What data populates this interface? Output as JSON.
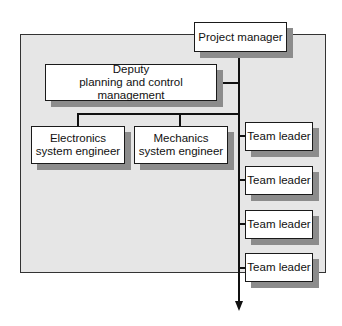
{
  "diagram": {
    "type": "org-chart",
    "colors": {
      "panel_fill": "#e6e6e6",
      "box_fill": "#ffffff",
      "box_border": "#1a1a1a",
      "shadow": "#8c8c8c",
      "line": "#111111"
    },
    "nodes": {
      "project_manager": {
        "lines": [
          "Project manager"
        ]
      },
      "deputy": {
        "lines": [
          "Deputy",
          "planning and control management"
        ]
      },
      "electronics": {
        "lines": [
          "Electronics",
          "system engineer"
        ]
      },
      "mechanics": {
        "lines": [
          "Mechanics",
          "system engineer"
        ]
      },
      "team_leaders": [
        {
          "label": "Team leader"
        },
        {
          "label": "Team leader"
        },
        {
          "label": "Team leader"
        },
        {
          "label": "Team leader"
        }
      ]
    },
    "edges": [
      {
        "from": "project_manager",
        "to": "deputy"
      },
      {
        "from": "project_manager",
        "to": "electronics"
      },
      {
        "from": "project_manager",
        "to": "mechanics"
      },
      {
        "from": "project_manager",
        "to": "team_leader_1"
      },
      {
        "from": "project_manager",
        "to": "team_leader_2"
      },
      {
        "from": "project_manager",
        "to": "team_leader_3"
      },
      {
        "from": "project_manager",
        "to": "team_leader_4"
      },
      {
        "from": "project_manager",
        "to": "continuation-arrow"
      }
    ]
  }
}
